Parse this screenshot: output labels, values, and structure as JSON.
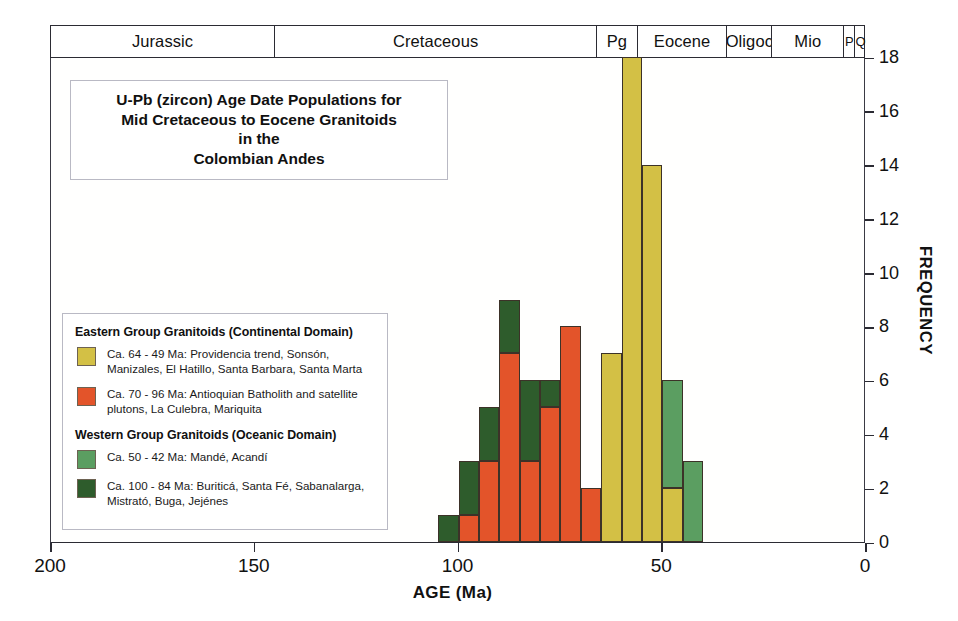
{
  "title": {
    "lines": [
      "U-Pb (zircon) Age Date Populations for",
      "Mid Cretaceous to Eocene Granitoids",
      "in the",
      "Colombian Andes"
    ]
  },
  "colors": {
    "eastern_young_khaki": "#d3c045",
    "eastern_old_orange": "#e3542a",
    "western_young_green": "#5b9e61",
    "western_old_darkgreen": "#2e5c2c",
    "axis": "#2b2b33",
    "frame_border": "#b9b9c4"
  },
  "legend": {
    "groups": [
      {
        "title": "Eastern Group Granitoids (Continental Domain)",
        "entries": [
          {
            "swatch_name": "legend-swatch-khaki",
            "color": "#d3c045",
            "text": "Ca. 64 - 49 Ma: Providencia trend, Sonsón, Manizales, El Hatillo, Santa Barbara, Santa Marta"
          },
          {
            "swatch_name": "legend-swatch-orange",
            "color": "#e3542a",
            "text": "Ca. 70 - 96 Ma: Antioquian Batholith and satellite plutons, La Culebra, Mariquita"
          }
        ]
      },
      {
        "title": "Western Group Granitoids (Oceanic Domain)",
        "entries": [
          {
            "swatch_name": "legend-swatch-green",
            "color": "#5b9e61",
            "text": "Ca. 50 - 42 Ma: Mandé, Acandí"
          },
          {
            "swatch_name": "legend-swatch-darkgreen",
            "color": "#2e5c2c",
            "text": "Ca. 100 - 84 Ma: Buriticá, Santa Fé, Sabanalarga, Mistrató, Buga, Jejénes"
          }
        ]
      }
    ]
  },
  "timescale": {
    "label": "Geologic Time Scale",
    "cells": [
      {
        "name": "Jurassic",
        "start_ma": 200,
        "end_ma": 145
      },
      {
        "name": "Cretaceous",
        "start_ma": 145,
        "end_ma": 66
      },
      {
        "name": "Pg",
        "start_ma": 66,
        "end_ma": 56
      },
      {
        "name": "Eocene",
        "start_ma": 56,
        "end_ma": 34
      },
      {
        "name": "Oligoc",
        "start_ma": 34,
        "end_ma": 23
      },
      {
        "name": "Mio",
        "start_ma": 23,
        "end_ma": 5.3
      },
      {
        "name": "P",
        "start_ma": 5.3,
        "end_ma": 2.6
      },
      {
        "name": "Q",
        "start_ma": 2.6,
        "end_ma": 0
      }
    ]
  },
  "chart_data": {
    "type": "bar",
    "subtitle": "",
    "xlabel": "AGE (Ma)",
    "ylabel": "FREQUENCY",
    "xlim": [
      200,
      0
    ],
    "ylim": [
      0,
      18
    ],
    "x_ticks": [
      200,
      150,
      100,
      50,
      0
    ],
    "y_ticks": [
      0,
      2,
      4,
      6,
      8,
      10,
      12,
      14,
      16,
      18
    ],
    "x_axis_reversed": true,
    "grid": false,
    "legend_position": "inside-left",
    "bin_width_ma": 5,
    "stacked": true,
    "series": [
      {
        "name": "Ca. 64 - 49 Ma: Providencia trend, Sonsón, Manizales, El Hatillo, Santa Barbara, Santa Marta",
        "key": "eastern_young_khaki",
        "color": "#d3c045"
      },
      {
        "name": "Ca. 70 - 96 Ma: Antioquian Batholith and satellite plutons, La Culebra, Mariquita",
        "key": "eastern_old_orange",
        "color": "#e3542a"
      },
      {
        "name": "Ca. 50 - 42 Ma: Mandé, Acandí",
        "key": "western_young_green",
        "color": "#5b9e61"
      },
      {
        "name": "Ca. 100 - 84 Ma: Buriticá, Santa Fé, Sabanalarga, Mistrató, Buga, Jejénes",
        "key": "western_old_darkgreen",
        "color": "#2e5c2c"
      }
    ],
    "bins": [
      {
        "start_ma": 105,
        "end_ma": 100,
        "total": 1,
        "segments": [
          {
            "key": "western_old_darkgreen",
            "value": 1
          }
        ]
      },
      {
        "start_ma": 100,
        "end_ma": 95,
        "total": 3,
        "segments": [
          {
            "key": "eastern_old_orange",
            "value": 1
          },
          {
            "key": "western_old_darkgreen",
            "value": 2
          }
        ]
      },
      {
        "start_ma": 95,
        "end_ma": 90,
        "total": 5,
        "segments": [
          {
            "key": "eastern_old_orange",
            "value": 3
          },
          {
            "key": "western_old_darkgreen",
            "value": 2
          }
        ]
      },
      {
        "start_ma": 90,
        "end_ma": 85,
        "total": 9,
        "segments": [
          {
            "key": "eastern_old_orange",
            "value": 7
          },
          {
            "key": "western_old_darkgreen",
            "value": 2
          }
        ]
      },
      {
        "start_ma": 85,
        "end_ma": 80,
        "total": 6,
        "segments": [
          {
            "key": "eastern_old_orange",
            "value": 3
          },
          {
            "key": "western_old_darkgreen",
            "value": 3
          }
        ]
      },
      {
        "start_ma": 80,
        "end_ma": 75,
        "total": 6,
        "segments": [
          {
            "key": "eastern_old_orange",
            "value": 5
          },
          {
            "key": "western_old_darkgreen",
            "value": 1
          }
        ]
      },
      {
        "start_ma": 75,
        "end_ma": 70,
        "total": 8,
        "segments": [
          {
            "key": "eastern_old_orange",
            "value": 8
          }
        ]
      },
      {
        "start_ma": 70,
        "end_ma": 65,
        "total": 2,
        "segments": [
          {
            "key": "eastern_old_orange",
            "value": 2
          }
        ]
      },
      {
        "start_ma": 65,
        "end_ma": 60,
        "total": 7,
        "segments": [
          {
            "key": "eastern_young_khaki",
            "value": 7
          }
        ]
      },
      {
        "start_ma": 60,
        "end_ma": 55,
        "total": 18,
        "segments": [
          {
            "key": "eastern_young_khaki",
            "value": 18
          }
        ]
      },
      {
        "start_ma": 55,
        "end_ma": 50,
        "total": 14,
        "segments": [
          {
            "key": "eastern_young_khaki",
            "value": 14
          }
        ]
      },
      {
        "start_ma": 50,
        "end_ma": 45,
        "total": 6,
        "segments": [
          {
            "key": "eastern_young_khaki",
            "value": 2
          },
          {
            "key": "western_young_green",
            "value": 4
          }
        ]
      },
      {
        "start_ma": 45,
        "end_ma": 40,
        "total": 3,
        "segments": [
          {
            "key": "western_young_green",
            "value": 3
          }
        ]
      }
    ]
  }
}
